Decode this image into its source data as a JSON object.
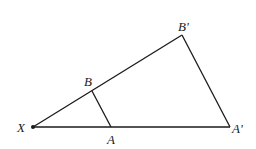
{
  "diagram": {
    "type": "geometry-similar-triangles",
    "points": {
      "X": {
        "label": "X",
        "x": 33,
        "y": 127
      },
      "A": {
        "label": "A",
        "x": 111,
        "y": 127
      },
      "A_prime": {
        "label": "A'",
        "x": 230,
        "y": 127
      },
      "B": {
        "label": "B",
        "x": 92,
        "y": 91
      },
      "B_prime": {
        "label": "B'",
        "x": 182,
        "y": 35
      }
    },
    "segments": [
      [
        "X",
        "A_prime"
      ],
      [
        "X",
        "B_prime"
      ],
      [
        "B",
        "A"
      ],
      [
        "B_prime",
        "A_prime"
      ]
    ],
    "line_color": "#1a1a1a"
  }
}
